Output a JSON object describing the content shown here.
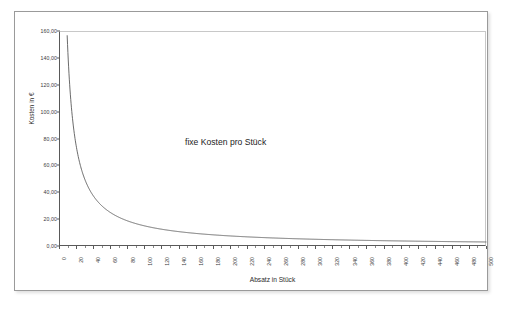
{
  "chart_data": {
    "type": "line",
    "title": "",
    "annotation": "fixe Kosten pro Stück",
    "xlabel": "Absatz in Stück",
    "ylabel": "Kosten in €",
    "xlim": [
      0,
      500
    ],
    "ylim": [
      0,
      160
    ],
    "grid": false,
    "legend": "none",
    "xticks": [
      "0",
      "20",
      "40",
      "60",
      "80",
      "100",
      "120",
      "140",
      "160",
      "180",
      "200",
      "220",
      "240",
      "260",
      "280",
      "300",
      "320",
      "340",
      "360",
      "380",
      "400",
      "420",
      "440",
      "460",
      "480",
      "500"
    ],
    "yticks": [
      "0,00",
      "20,00",
      "40,00",
      "60,00",
      "80,00",
      "100,00",
      "120,00",
      "140,00",
      "160,00"
    ],
    "series": [
      {
        "name": "fixe Kosten pro Stück",
        "color": "#5a5a5a",
        "formula": "y = 1500 / x",
        "x": [
          10,
          20,
          30,
          40,
          50,
          60,
          70,
          80,
          90,
          100,
          120,
          140,
          160,
          180,
          200,
          220,
          240,
          260,
          280,
          300,
          320,
          340,
          360,
          380,
          400,
          420,
          440,
          460,
          480,
          500
        ],
        "values": [
          150.0,
          75.0,
          50.0,
          37.5,
          30.0,
          25.0,
          21.43,
          18.75,
          16.67,
          15.0,
          12.5,
          10.71,
          9.38,
          8.33,
          7.5,
          6.82,
          6.25,
          5.77,
          5.36,
          5.0,
          4.69,
          4.41,
          4.17,
          3.95,
          3.75,
          3.57,
          3.41,
          3.26,
          3.13,
          3.0
        ]
      }
    ]
  },
  "colors": {
    "curve": "#5a5a5a",
    "axis": "#595959",
    "plot_border": "#c8c8c8",
    "frame": "#9a9a9a",
    "text": "#2b2b2b",
    "background": "#ffffff"
  }
}
